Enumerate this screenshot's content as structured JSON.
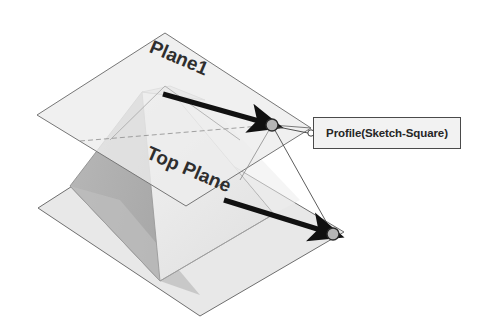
{
  "viewport": {
    "background_color": "#ffffff",
    "title": "CAD 3D viewport"
  },
  "annotations": {
    "callout": {
      "label": "Profile(Sketch-Square)",
      "box_border_color": "#4a4a4a",
      "box_fill_color": "#f2f2f2",
      "leader_anchor_point": "profile-vertex"
    },
    "plane_labels": [
      {
        "name": "plane1-label",
        "text": "Plane1"
      },
      {
        "name": "top-plane-label",
        "text": "Top Plane"
      }
    ],
    "arrows": [
      {
        "name": "upper-profile-arrow",
        "from_x": 163,
        "from_y": 94,
        "to_x": 272,
        "to_y": 125,
        "color": "#111111"
      },
      {
        "name": "lower-profile-arrow",
        "from_x": 224,
        "from_y": 200,
        "to_x": 333,
        "to_y": 234,
        "color": "#111111"
      }
    ],
    "vertex_markers": [
      {
        "name": "profile-vertex-upper",
        "cx": 272,
        "cy": 125,
        "r": 6
      },
      {
        "name": "profile-vertex-lower",
        "cx": 333,
        "cy": 234,
        "r": 6
      }
    ]
  },
  "geometry": {
    "upper_plane": {
      "name": "Plane1",
      "fill_color": "#ebebeb",
      "edge_color": "#777777",
      "corners": "37,115 165,33 311,128 186,206"
    },
    "lower_plane": {
      "name": "Top Plane",
      "fill_color": "#e3e3e3",
      "edge_color": "#6e6e6e",
      "corners": "38,208 166,126 344,232 200,316"
    },
    "solid": {
      "name": "pyramid-frustum",
      "left_face_color": "#b4b4b4",
      "right_face_color": "#efefef",
      "front_face_color": "#d2d2d2",
      "edge_color": "#8a8a8a"
    }
  },
  "colors": {
    "line_dark": "#111111",
    "line_mid": "#5a5a5a",
    "line_light": "#9a9a9a",
    "text_dark": "#262626"
  }
}
